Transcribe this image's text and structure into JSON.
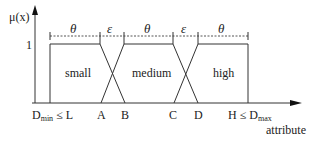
{
  "diagram": {
    "y_axis_label": "μ(x)",
    "y_tick_label": "1",
    "x_axis_label": "attribute",
    "x_ticks": {
      "left": "D",
      "left_sub": "min",
      "left_rel": " ≤ L",
      "A": "A",
      "B": "B",
      "C": "C",
      "D": "D",
      "right_pre": "H ≤ D",
      "right_sub": "max"
    },
    "regions": [
      "small",
      "medium",
      "high"
    ],
    "intervals": [
      "θ",
      "ε",
      "θ",
      "ε",
      "θ"
    ],
    "colors": {
      "line": "#333333",
      "dashed": "#555555"
    }
  }
}
